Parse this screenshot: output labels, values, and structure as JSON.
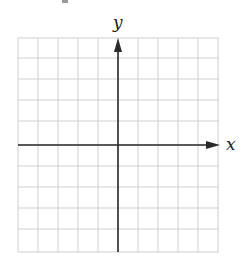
{
  "diagram": {
    "type": "coordinate-plane",
    "x_axis_label": "x",
    "y_axis_label": "y",
    "grid": {
      "columns": 10,
      "rows": 10,
      "cell_size_px": 20,
      "line_color": "#cfcfcf"
    },
    "axis_color": "#2a2a2a",
    "origin_px": [
      118,
      145
    ]
  },
  "chart_data": {
    "type": "scatter",
    "title": "",
    "xlabel": "x",
    "ylabel": "y",
    "grid": true,
    "points": [],
    "xlim": [
      -5,
      5
    ],
    "ylim": [
      -5,
      5
    ]
  }
}
